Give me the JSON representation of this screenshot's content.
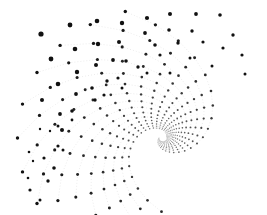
{
  "artwork": {
    "title": "Dot spiral",
    "background": "#ffffff",
    "dot_color": "#111111",
    "arc_color": "#d9d9d9",
    "width": 267,
    "height": 215,
    "center": [
      163,
      138
    ]
  },
  "large_dots": [
    [
      41,
      34,
      2.6
    ],
    [
      70,
      25,
      2.4
    ],
    [
      97,
      21,
      2.3
    ],
    [
      122,
      23,
      2.2
    ],
    [
      147,
      18,
      2.1
    ],
    [
      170,
      14,
      2.0
    ],
    [
      196,
      14,
      1.9
    ],
    [
      220,
      15,
      1.8
    ],
    [
      51,
      59,
      2.4
    ],
    [
      75,
      49,
      2.3
    ],
    [
      98,
      44,
      2.2
    ],
    [
      119,
      42,
      2.0
    ],
    [
      145,
      33,
      1.9
    ],
    [
      169,
      30,
      1.8
    ],
    [
      192,
      31,
      1.7
    ],
    [
      233,
      35,
      1.7
    ],
    [
      58,
      84,
      2.3
    ],
    [
      77,
      72,
      2.2
    ],
    [
      96,
      65,
      2.0
    ],
    [
      113,
      60,
      1.9
    ],
    [
      126,
      61,
      1.8
    ],
    [
      155,
      45,
      1.8
    ],
    [
      178,
      43,
      1.7
    ],
    [
      203,
      42,
      1.6
    ],
    [
      223,
      48,
      1.6
    ],
    [
      42,
      100,
      2.0
    ],
    [
      76,
      94,
      1.9
    ],
    [
      92,
      88,
      1.8
    ],
    [
      107,
      81,
      1.7
    ],
    [
      118,
      78,
      1.6
    ],
    [
      138,
      67,
      1.7
    ],
    [
      160,
      55,
      1.6
    ],
    [
      190,
      58,
      1.5
    ],
    [
      242,
      55,
      1.6
    ],
    [
      60,
      114,
      1.9
    ],
    [
      72,
      111,
      1.8
    ],
    [
      95,
      100,
      1.7
    ],
    [
      104,
      95,
      1.6
    ],
    [
      122,
      88,
      1.5
    ],
    [
      147,
      73,
      1.5
    ],
    [
      170,
      73,
      1.5
    ],
    [
      212,
      66,
      1.5
    ],
    [
      245,
      74,
      1.5
    ],
    [
      62,
      130,
      2.0
    ],
    [
      58,
      146,
      1.6
    ],
    [
      44,
      158,
      1.6
    ],
    [
      54,
      168,
      1.8
    ],
    [
      48,
      181,
      1.7
    ],
    [
      30,
      190,
      1.6
    ],
    [
      40,
      200,
      1.5
    ],
    [
      28,
      178,
      1.3
    ],
    [
      29,
      152,
      1.3
    ],
    [
      58,
      126,
      1.5
    ],
    [
      63,
      150,
      1.5
    ],
    [
      72,
      120,
      1.4
    ],
    [
      50,
      131,
      1.2
    ],
    [
      40,
      129,
      1.2
    ],
    [
      33,
      161,
      1.2
    ]
  ],
  "spiral": {
    "arms": 15,
    "points_per_arm": 26,
    "growth": 0.115,
    "start_radius": 4,
    "min_dot": 0.35,
    "max_dot": 1.7
  }
}
